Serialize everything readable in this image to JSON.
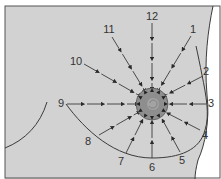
{
  "diagram": {
    "type": "breast self-examination radial pattern",
    "colors": {
      "background": "#d2d2d2",
      "outside": "#ffffff",
      "areola": "#8e8e8e",
      "nipple": "#a8a8a8",
      "line": "#3a3a3a",
      "border": "#3a3a3a"
    },
    "center": {
      "x": 152,
      "y": 104
    },
    "labels": [
      {
        "text": "1",
        "x": 193,
        "y": 33
      },
      {
        "text": "2",
        "x": 206,
        "y": 75
      },
      {
        "text": "3",
        "x": 211,
        "y": 107
      },
      {
        "text": "4",
        "x": 205,
        "y": 139
      },
      {
        "text": "5",
        "x": 182,
        "y": 164
      },
      {
        "text": "6",
        "x": 152,
        "y": 171
      },
      {
        "text": "7",
        "x": 121,
        "y": 165
      },
      {
        "text": "8",
        "x": 88,
        "y": 145
      },
      {
        "text": "9",
        "x": 61,
        "y": 107
      },
      {
        "text": "10",
        "x": 76,
        "y": 65
      },
      {
        "text": "11",
        "x": 109,
        "y": 33
      },
      {
        "text": "12",
        "x": 152,
        "y": 20
      }
    ],
    "arrows": [
      {
        "id": "1",
        "x1": 191,
        "y1": 36,
        "x2": 158,
        "y2": 91
      },
      {
        "id": "2",
        "x1": 203,
        "y1": 76,
        "x2": 164,
        "y2": 96
      },
      {
        "id": "3",
        "x1": 207,
        "y1": 104,
        "x2": 167,
        "y2": 104
      },
      {
        "id": "4",
        "x1": 200,
        "y1": 130,
        "x2": 165,
        "y2": 112
      },
      {
        "id": "5",
        "x1": 180,
        "y1": 152,
        "x2": 161,
        "y2": 117
      },
      {
        "id": "6",
        "x1": 152,
        "y1": 158,
        "x2": 152,
        "y2": 119
      },
      {
        "id": "7",
        "x1": 126,
        "y1": 153,
        "x2": 144,
        "y2": 117
      },
      {
        "id": "8",
        "x1": 99,
        "y1": 135,
        "x2": 139,
        "y2": 112
      },
      {
        "id": "9",
        "x1": 67,
        "y1": 104,
        "x2": 137,
        "y2": 104
      },
      {
        "id": "10",
        "x1": 84,
        "y1": 64,
        "x2": 140,
        "y2": 96
      },
      {
        "id": "11",
        "x1": 112,
        "y1": 37,
        "x2": 145,
        "y2": 91
      },
      {
        "id": "12",
        "x1": 152,
        "y1": 23,
        "x2": 152,
        "y2": 89
      }
    ]
  }
}
